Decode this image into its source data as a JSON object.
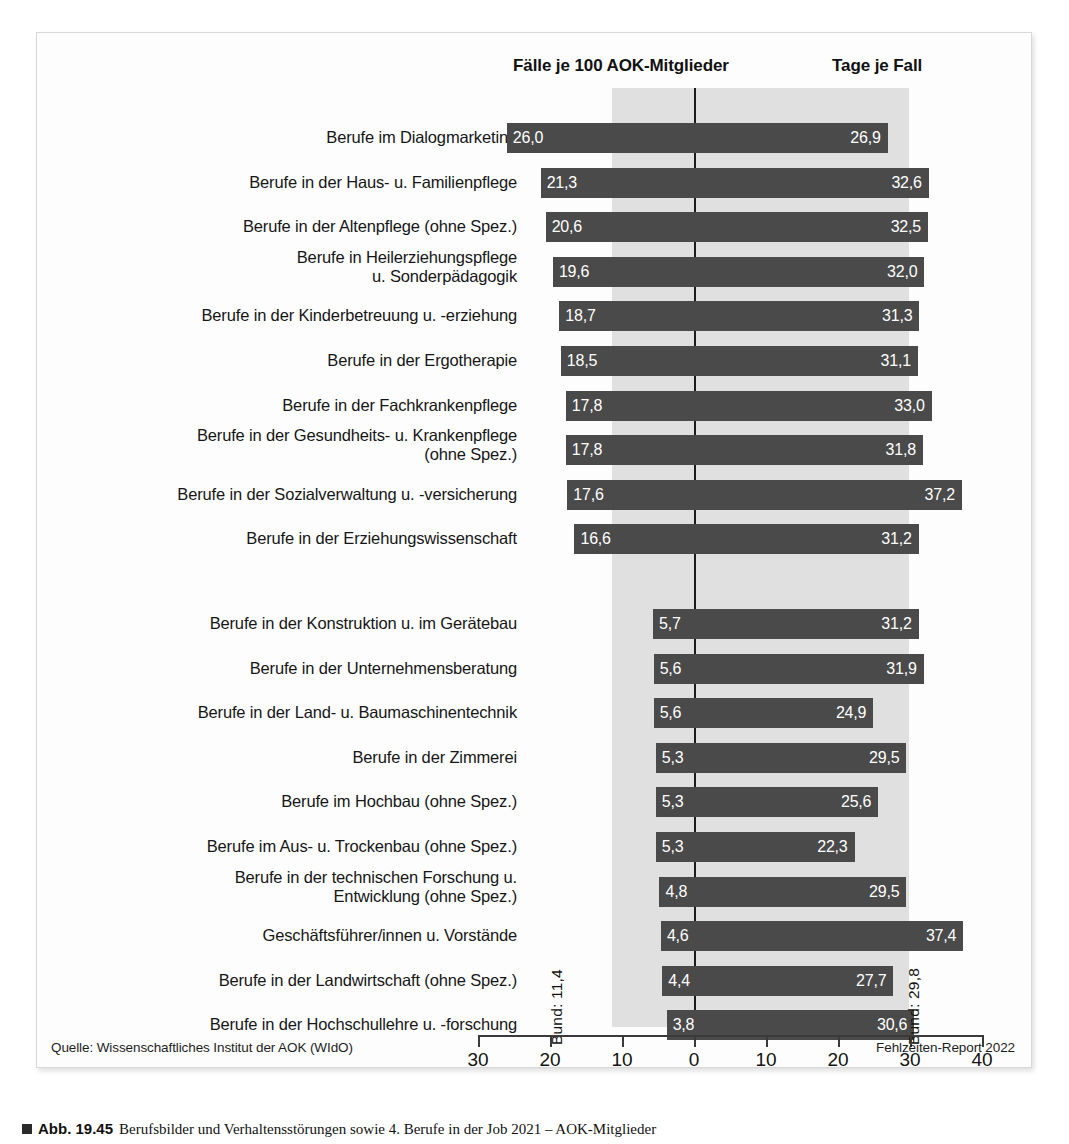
{
  "figure": {
    "headers": {
      "left": "Fälle je 100 AOK-Mitglieder",
      "right": "Tage je Fall"
    },
    "reference": {
      "left_label": "Bund: 11,4",
      "right_label": "Bund: 29,8",
      "left_value": 11.4,
      "right_value": 29.8
    },
    "axis": {
      "ticks": [
        {
          "label": "30",
          "value": -30
        },
        {
          "label": "20",
          "value": -20
        },
        {
          "label": "10",
          "value": -10
        },
        {
          "label": "0",
          "value": 0
        },
        {
          "label": "10",
          "value": 10
        },
        {
          "label": "20",
          "value": 20
        },
        {
          "label": "30",
          "value": 30
        },
        {
          "label": "40",
          "value": 40
        }
      ]
    },
    "footer": {
      "source": "Quelle: Wissenschaftliches Institut der AOK (WIdO)",
      "report": "Fehlzeiten-Report 2022"
    }
  },
  "caption": {
    "marker": "square-marker",
    "number": "Abb. 19.45",
    "text": "Berufsbilder und Verhaltensstörungen sowie 4. Berufe in der Job 2021 – AOK-Mitglieder"
  },
  "chart_data": {
    "type": "bar",
    "title": "",
    "subtitle": "",
    "orientation": "horizontal",
    "style": "diverging-butterfly",
    "xlabel": "",
    "ylabel": "",
    "xlim": [
      -33,
      42
    ],
    "grid": false,
    "legend_position": "top",
    "series": [
      {
        "name": "Fälle je 100 AOK-Mitglieder",
        "direction": "left"
      },
      {
        "name": "Tage je Fall",
        "direction": "right"
      }
    ],
    "reference_lines": {
      "Bund Fälle": 11.4,
      "Bund Tage": 29.8
    },
    "categories": [
      "Berufe im Dialogmarketing",
      "Berufe in der Haus- u. Familienpflege",
      "Berufe in der Altenpflege (ohne Spez.)",
      "Berufe in Heilerziehungspflege\nu. Sonderpädagogik",
      "Berufe in der Kinderbetreuung u. -erziehung",
      "Berufe in der Ergotherapie",
      "Berufe in der Fachkrankenpflege",
      "Berufe in der Gesundheits- u. Krankenpflege\n(ohne Spez.)",
      "Berufe in der Sozialverwaltung u. -versicherung",
      "Berufe in der Erziehungswissenschaft",
      "Berufe in der Konstruktion u. im Gerätebau",
      "Berufe in der Unternehmensberatung",
      "Berufe in der Land- u. Baumaschinentechnik",
      "Berufe in der Zimmerei",
      "Berufe im Hochbau (ohne Spez.)",
      "Berufe im Aus- u. Trockenbau (ohne Spez.)",
      "Berufe in der technischen Forschung u.\nEntwicklung (ohne Spez.)",
      "Geschäftsführer/innen u. Vorstände",
      "Berufe in der Landwirtschaft (ohne Spez.)",
      "Berufe in der Hochschullehre u. -forschung"
    ],
    "faelle": [
      26.0,
      21.3,
      20.6,
      19.6,
      18.7,
      18.5,
      17.8,
      17.8,
      17.6,
      16.6,
      5.7,
      5.6,
      5.6,
      5.3,
      5.3,
      5.3,
      4.8,
      4.6,
      4.4,
      3.8
    ],
    "tage": [
      26.9,
      32.6,
      32.5,
      32.0,
      31.3,
      31.1,
      33.0,
      31.8,
      37.2,
      31.2,
      31.2,
      31.9,
      24.9,
      29.5,
      25.6,
      22.3,
      29.5,
      37.4,
      27.7,
      30.6
    ],
    "faelle_labels": [
      "26,0",
      "21,3",
      "20,6",
      "19,6",
      "18,7",
      "18,5",
      "17,8",
      "17,8",
      "17,6",
      "16,6",
      "5,7",
      "5,6",
      "5,6",
      "5,3",
      "5,3",
      "5,3",
      "4,8",
      "4,6",
      "4,4",
      "3,8"
    ],
    "tage_labels": [
      "26,9",
      "32,6",
      "32,5",
      "32,0",
      "31,3",
      "31,1",
      "33,0",
      "31,8",
      "37,2",
      "31,2",
      "31,2",
      "31,9",
      "24,9",
      "29,5",
      "25,6",
      "22,3",
      "29,5",
      "37,4",
      "27,7",
      "30,6"
    ],
    "gap_after_index": 9,
    "bar_color": "#4a4a4a",
    "band_color": "#e0e0e0"
  }
}
